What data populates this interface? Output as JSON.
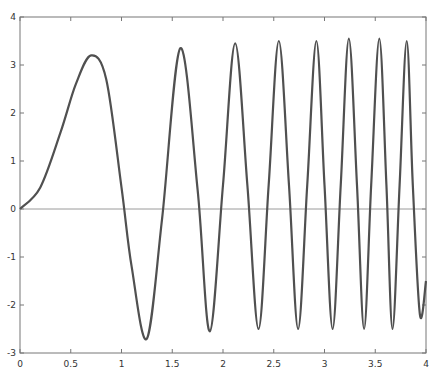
{
  "chart_data": {
    "type": "line",
    "title": "",
    "xlabel": "",
    "ylabel": "",
    "xlim": [
      0,
      4
    ],
    "ylim": [
      -3,
      4
    ],
    "grid": false,
    "legend": null,
    "xticks": [
      0,
      0.5,
      1,
      1.5,
      2,
      2.5,
      3,
      3.5,
      4
    ],
    "xtick_labels": [
      "0",
      "0.5",
      "1",
      "1.5",
      "2",
      "2.5",
      "3",
      "3.5",
      "4"
    ],
    "yticks": [
      -3,
      -2,
      -1,
      0,
      1,
      2,
      3,
      4
    ],
    "ytick_labels": [
      "-3",
      "-2",
      "-1",
      "0",
      "1",
      "2",
      "3",
      "4"
    ],
    "reference_line": {
      "y": 0,
      "color": "#9a9a9a"
    },
    "series": [
      {
        "name": "response",
        "color": "#505050",
        "points": [
          [
            0,
            0
          ],
          [
            0.2,
            0.45
          ],
          [
            0.4,
            1.6
          ],
          [
            0.55,
            2.6
          ],
          [
            0.7,
            3.2
          ],
          [
            0.85,
            2.7
          ],
          [
            1.0,
            0.45
          ],
          [
            1.1,
            -1.2
          ],
          [
            1.25,
            -2.7
          ],
          [
            1.4,
            -0.2
          ],
          [
            1.58,
            3.35
          ],
          [
            1.75,
            0.4
          ],
          [
            1.87,
            -2.55
          ],
          [
            2.0,
            0.5
          ],
          [
            2.12,
            3.45
          ],
          [
            2.24,
            0.5
          ],
          [
            2.35,
            -2.5
          ],
          [
            2.45,
            0.5
          ],
          [
            2.55,
            3.5
          ],
          [
            2.65,
            0.5
          ],
          [
            2.74,
            -2.5
          ],
          [
            2.83,
            0.5
          ],
          [
            2.92,
            3.5
          ],
          [
            3.0,
            0.5
          ],
          [
            3.08,
            -2.5
          ],
          [
            3.16,
            0.5
          ],
          [
            3.24,
            3.55
          ],
          [
            3.32,
            0.5
          ],
          [
            3.39,
            -2.5
          ],
          [
            3.46,
            0.5
          ],
          [
            3.54,
            3.55
          ],
          [
            3.61,
            0.5
          ],
          [
            3.67,
            -2.5
          ],
          [
            3.74,
            0.5
          ],
          [
            3.81,
            3.5
          ],
          [
            3.87,
            0.5
          ],
          [
            3.94,
            -2.2
          ],
          [
            4.0,
            -1.5
          ]
        ]
      }
    ]
  }
}
